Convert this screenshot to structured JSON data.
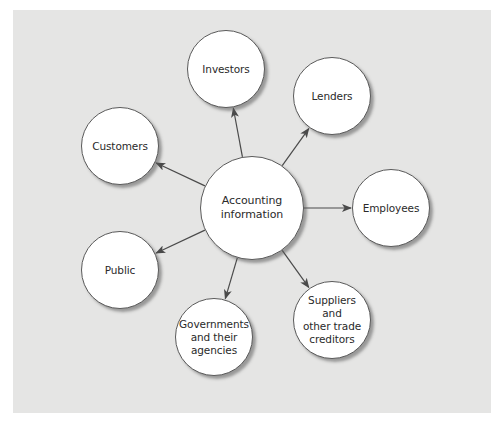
{
  "diagram": {
    "title": "",
    "background_color": "#e5e5e4",
    "center": {
      "id": "accounting-information",
      "label": "Accounting\ninformation",
      "cx": 252,
      "cy": 208,
      "r": 52
    },
    "nodes": [
      {
        "id": "investors",
        "label": "Investors",
        "cx": 226,
        "cy": 69,
        "r": 39
      },
      {
        "id": "lenders",
        "label": "Lenders",
        "cx": 332,
        "cy": 96,
        "r": 39
      },
      {
        "id": "employees",
        "label": "Employees",
        "cx": 391,
        "cy": 208,
        "r": 39
      },
      {
        "id": "suppliers",
        "label": "Suppliers\nand\nother trade\ncreditors",
        "cx": 332,
        "cy": 320,
        "r": 39
      },
      {
        "id": "governments",
        "label": "Governments\nand their\nagencies",
        "cx": 214,
        "cy": 337,
        "r": 39
      },
      {
        "id": "public",
        "label": "Public",
        "cx": 120,
        "cy": 270,
        "r": 39
      },
      {
        "id": "customers",
        "label": "Customers",
        "cx": 120,
        "cy": 146,
        "r": 39
      }
    ],
    "edges": [
      {
        "from": "accounting-information",
        "to": "investors",
        "direction": "outward"
      },
      {
        "from": "accounting-information",
        "to": "lenders",
        "direction": "outward"
      },
      {
        "from": "accounting-information",
        "to": "employees",
        "direction": "outward"
      },
      {
        "from": "accounting-information",
        "to": "suppliers",
        "direction": "outward"
      },
      {
        "from": "accounting-information",
        "to": "governments",
        "direction": "outward"
      },
      {
        "from": "accounting-information",
        "to": "public",
        "direction": "outward"
      },
      {
        "from": "accounting-information",
        "to": "customers",
        "direction": "outward"
      }
    ],
    "line_color": "#4a4a4a"
  }
}
